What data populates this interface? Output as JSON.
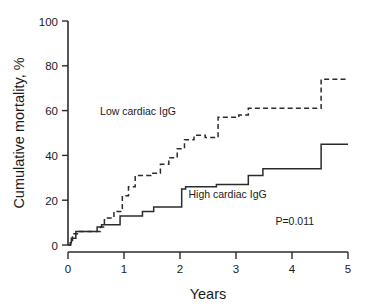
{
  "chart_data": {
    "type": "line",
    "title": "",
    "xlabel": "Years",
    "ylabel": "Cumulative mortality, %",
    "xlim": [
      0,
      5
    ],
    "ylim": [
      0,
      100
    ],
    "xticks": [
      0,
      1,
      2,
      3,
      4,
      5
    ],
    "xtick_labels": [
      "0",
      "1",
      "2",
      "3",
      "4",
      "5"
    ],
    "yticks": [
      0,
      20,
      40,
      60,
      80,
      100
    ],
    "ytick_labels": [
      "0",
      "20",
      "40",
      "60",
      "80",
      "100"
    ],
    "grid": false,
    "legend_position": "inline-annotation",
    "annotations": [
      {
        "name": "p-value",
        "text": "P=0.011",
        "x": 4.05,
        "y": 9
      }
    ],
    "series": [
      {
        "name": "Low cardiac IgG",
        "style": "dashed",
        "label": "Low cardiac IgG",
        "label_x": 1.25,
        "label_y": 58,
        "steps": [
          [
            0.0,
            0
          ],
          [
            0.05,
            2
          ],
          [
            0.08,
            5
          ],
          [
            0.18,
            5
          ],
          [
            0.2,
            6
          ],
          [
            0.55,
            6
          ],
          [
            0.58,
            8
          ],
          [
            0.62,
            8
          ],
          [
            0.65,
            12
          ],
          [
            0.8,
            12
          ],
          [
            0.82,
            15
          ],
          [
            0.95,
            15
          ],
          [
            0.97,
            22
          ],
          [
            1.05,
            22
          ],
          [
            1.08,
            26
          ],
          [
            1.18,
            26
          ],
          [
            1.2,
            31
          ],
          [
            1.45,
            31
          ],
          [
            1.48,
            32
          ],
          [
            1.62,
            32
          ],
          [
            1.65,
            36
          ],
          [
            1.78,
            36
          ],
          [
            1.8,
            39
          ],
          [
            1.92,
            39
          ],
          [
            1.95,
            43
          ],
          [
            2.05,
            43
          ],
          [
            2.08,
            47
          ],
          [
            2.22,
            47
          ],
          [
            2.25,
            49
          ],
          [
            2.42,
            49
          ],
          [
            2.45,
            48
          ],
          [
            2.62,
            48
          ],
          [
            2.68,
            57
          ],
          [
            3.0,
            57
          ],
          [
            3.05,
            58
          ],
          [
            3.18,
            58
          ],
          [
            3.22,
            61
          ],
          [
            4.48,
            61
          ],
          [
            4.52,
            74
          ],
          [
            5.0,
            74
          ]
        ]
      },
      {
        "name": "High cardiac IgG",
        "style": "solid",
        "label": "High cardiac IgG",
        "label_x": 2.85,
        "label_y": 21,
        "steps": [
          [
            0.0,
            0
          ],
          [
            0.04,
            1
          ],
          [
            0.06,
            3
          ],
          [
            0.12,
            3
          ],
          [
            0.14,
            6
          ],
          [
            0.5,
            6
          ],
          [
            0.52,
            8
          ],
          [
            0.58,
            8
          ],
          [
            0.6,
            9
          ],
          [
            0.9,
            9
          ],
          [
            0.93,
            13
          ],
          [
            1.3,
            13
          ],
          [
            1.33,
            15
          ],
          [
            1.5,
            15
          ],
          [
            1.53,
            17
          ],
          [
            2.0,
            17
          ],
          [
            2.03,
            25
          ],
          [
            2.08,
            25
          ],
          [
            2.1,
            26
          ],
          [
            2.62,
            26
          ],
          [
            2.65,
            27
          ],
          [
            3.18,
            27
          ],
          [
            3.22,
            31
          ],
          [
            3.45,
            31
          ],
          [
            3.48,
            34
          ],
          [
            4.48,
            34
          ],
          [
            4.52,
            45
          ],
          [
            5.0,
            45
          ]
        ]
      }
    ]
  },
  "axes": {
    "y_label": "Cumulative mortality, %",
    "x_label": "Years"
  }
}
